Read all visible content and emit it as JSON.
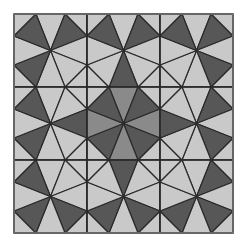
{
  "figure": {
    "origin": [
      14,
      14
    ],
    "cell_size": 73,
    "rows": 3,
    "cols": 3,
    "edge_points": [
      22,
      51
    ],
    "colors": {
      "background": "#ffffff",
      "light": "#c9c9c9",
      "mid": "#8a8a8a",
      "dark": "#575757",
      "line": "#2a2a2a"
    },
    "cells": [
      {
        "row": 0,
        "col": 0,
        "dark": [
          "TL",
          "TR",
          "BL"
        ],
        "mid": []
      },
      {
        "row": 0,
        "col": 1,
        "dark": [
          "TL",
          "TR",
          "B"
        ],
        "mid": []
      },
      {
        "row": 0,
        "col": 2,
        "dark": [
          "TL",
          "TR",
          "BR"
        ],
        "mid": []
      },
      {
        "row": 1,
        "col": 0,
        "dark": [
          "TL",
          "R",
          "BL"
        ],
        "mid": []
      },
      {
        "row": 1,
        "col": 1,
        "dark": [
          "TL",
          "TR",
          "BL",
          "BR"
        ],
        "mid": [
          "T",
          "R",
          "B",
          "L"
        ]
      },
      {
        "row": 1,
        "col": 2,
        "dark": [
          "L",
          "TR",
          "BR"
        ],
        "mid": []
      },
      {
        "row": 2,
        "col": 0,
        "dark": [
          "TL",
          "BL",
          "BR"
        ],
        "mid": []
      },
      {
        "row": 2,
        "col": 1,
        "dark": [
          "T",
          "BL",
          "BR"
        ],
        "mid": []
      },
      {
        "row": 2,
        "col": 2,
        "dark": [
          "TR",
          "BL",
          "BR"
        ],
        "mid": []
      }
    ]
  }
}
